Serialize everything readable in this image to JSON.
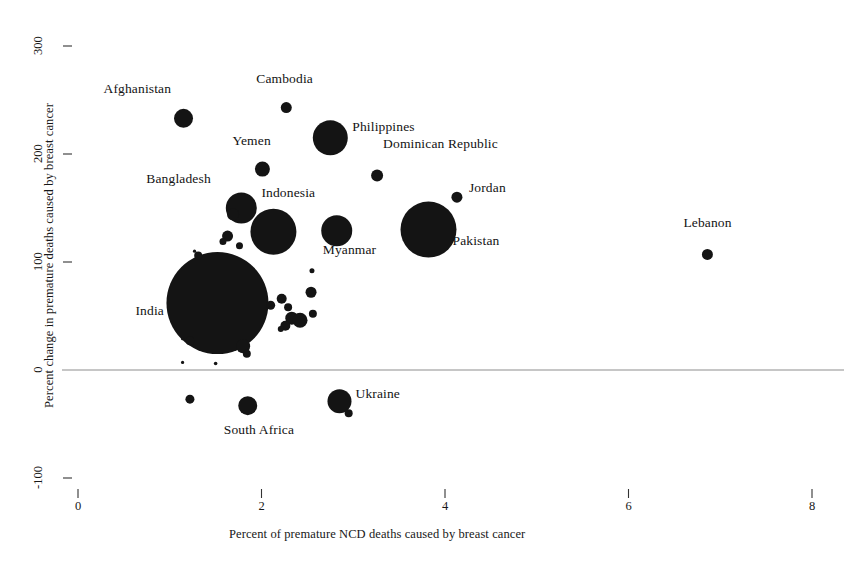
{
  "chart_data": {
    "type": "scatter",
    "title": "",
    "xlabel": "Percent of premature NCD deaths caused by breast cancer",
    "ylabel": "Percent change in premature deaths caused by breast cancer",
    "xlim": [
      0,
      8.4
    ],
    "ylim": [
      -130,
      310
    ],
    "xticks": [
      0,
      2,
      4,
      6,
      8
    ],
    "xtick_labels": [
      "0",
      "2",
      "4",
      "6",
      "8"
    ],
    "yticks": [
      -100,
      0,
      100,
      200,
      300
    ],
    "ytick_labels": [
      "-100",
      "0",
      "100",
      "200",
      "300"
    ],
    "grid": false,
    "legend": "none",
    "zero_reference_line": 0,
    "bubble_size_encodes": "number of premature deaths caused by breast cancer",
    "points": [
      {
        "label": "Afghanistan",
        "x": 1.15,
        "y": 233,
        "r": 9.5,
        "label_dx": -80,
        "label_dy": -28
      },
      {
        "label": "Cambodia",
        "x": 2.27,
        "y": 243,
        "r": 5.5,
        "label_dx": -30,
        "label_dy": -28
      },
      {
        "label": "Philippines",
        "x": 2.75,
        "y": 215,
        "r": 17.5,
        "label_dx": 22,
        "label_dy": -10
      },
      {
        "label": "Yemen",
        "x": 2.01,
        "y": 186,
        "r": 7.5,
        "label_dx": -30,
        "label_dy": -27
      },
      {
        "label": "Dominican Republic",
        "x": 3.26,
        "y": 180,
        "r": 6.0,
        "label_dx": 6,
        "label_dy": -31
      },
      {
        "label": "Jordan",
        "x": 4.13,
        "y": 160,
        "r": 5.5,
        "label_dx": 12,
        "label_dy": -8
      },
      {
        "label": "Bangladesh",
        "x": 1.78,
        "y": 150,
        "r": 15.5,
        "label_dx": -95,
        "label_dy": -28
      },
      {
        "label": "Indonesia",
        "x": 2.13,
        "y": 128,
        "r": 23.0,
        "label_dx": -12,
        "label_dy": -38
      },
      {
        "label": "Pakistan",
        "x": 3.82,
        "y": 130,
        "r": 28.0,
        "label_dx": 24,
        "label_dy": 12
      },
      {
        "label": "Myanmar",
        "x": 2.82,
        "y": 129,
        "r": 15.5,
        "label_dx": -14,
        "label_dy": 20
      },
      {
        "label": "Lebanon",
        "x": 6.86,
        "y": 107,
        "r": 5.5,
        "label_dx": -24,
        "label_dy": -30
      },
      {
        "label": "India",
        "x": 1.52,
        "y": 62,
        "r": 51.0,
        "label_dx": -82,
        "label_dy": 9
      },
      {
        "label": "Ukraine",
        "x": 2.85,
        "y": -29,
        "r": 12.0,
        "label_dx": 16,
        "label_dy": -6
      },
      {
        "label": "South Africa",
        "x": 1.85,
        "y": -33,
        "r": 9.5,
        "label_dx": -24,
        "label_dy": 25
      },
      {
        "label": "",
        "x": 1.69,
        "y": 144,
        "r": 6.0
      },
      {
        "label": "",
        "x": 1.63,
        "y": 124,
        "r": 5.5
      },
      {
        "label": "",
        "x": 1.58,
        "y": 119,
        "r": 3.5
      },
      {
        "label": "",
        "x": 1.76,
        "y": 115,
        "r": 3.5
      },
      {
        "label": "",
        "x": 1.31,
        "y": 106,
        "r": 4.0
      },
      {
        "label": "",
        "x": 1.27,
        "y": 110,
        "r": 1.6
      },
      {
        "label": "",
        "x": 2.55,
        "y": 92,
        "r": 2.5
      },
      {
        "label": "",
        "x": 2.54,
        "y": 72,
        "r": 5.5
      },
      {
        "label": "",
        "x": 2.56,
        "y": 52,
        "r": 4.0
      },
      {
        "label": "",
        "x": 2.22,
        "y": 66,
        "r": 5.0
      },
      {
        "label": "",
        "x": 2.29,
        "y": 58,
        "r": 4.0
      },
      {
        "label": "",
        "x": 2.1,
        "y": 60,
        "r": 4.5
      },
      {
        "label": "",
        "x": 2.33,
        "y": 48,
        "r": 6.5
      },
      {
        "label": "",
        "x": 2.42,
        "y": 46,
        "r": 7.5
      },
      {
        "label": "",
        "x": 2.26,
        "y": 41,
        "r": 5.0
      },
      {
        "label": "",
        "x": 2.21,
        "y": 38,
        "r": 3.0
      },
      {
        "label": "",
        "x": 1.8,
        "y": 22,
        "r": 7.0
      },
      {
        "label": "",
        "x": 1.84,
        "y": 15,
        "r": 4.0
      },
      {
        "label": "",
        "x": 1.22,
        "y": 27,
        "r": 4.5
      },
      {
        "label": "",
        "x": 1.14,
        "y": 29,
        "r": 1.6
      },
      {
        "label": "",
        "x": 1.14,
        "y": 7,
        "r": 1.6
      },
      {
        "label": "",
        "x": 1.5,
        "y": 6,
        "r": 1.8
      },
      {
        "label": "",
        "x": 1.22,
        "y": -27,
        "r": 4.5
      },
      {
        "label": "",
        "x": 2.95,
        "y": -40,
        "r": 4.0
      }
    ]
  },
  "axes": {
    "x_title": "Percent of premature NCD deaths caused by breast cancer",
    "y_title": "Percent change in premature deaths caused by breast cancer"
  },
  "caption": ""
}
